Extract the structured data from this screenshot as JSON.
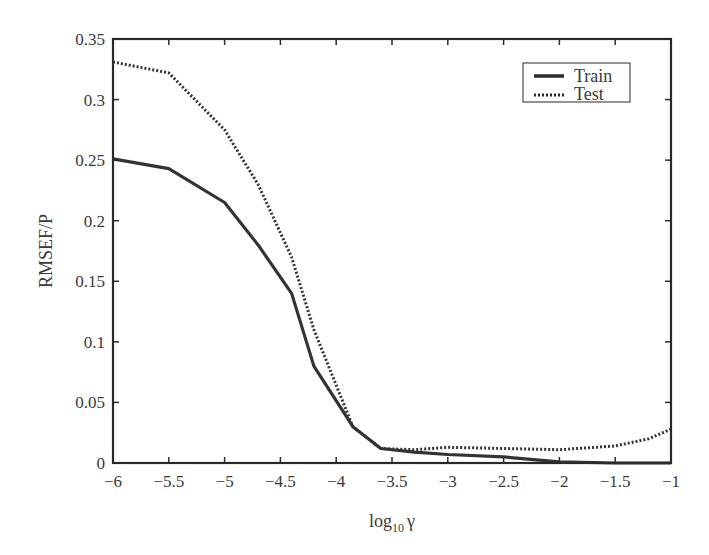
{
  "chart_data": {
    "type": "line",
    "title": "",
    "xlabel": "log10 γ",
    "xlabel_base": "log",
    "xlabel_sub": "10",
    "xlabel_var": "γ",
    "ylabel": "RMSEF/P",
    "xlim": [
      -6,
      -1
    ],
    "ylim": [
      0,
      0.35
    ],
    "xticks": [
      -6,
      -5.5,
      -5,
      -4.5,
      -4,
      -3.5,
      -3,
      -2.5,
      -2,
      -1.5,
      -1
    ],
    "xtick_labels": [
      "−6",
      "−5.5",
      "−5",
      "−4.5",
      "−4",
      "−3.5",
      "−3",
      "−2.5",
      "−2",
      "−1.5",
      "−1"
    ],
    "yticks": [
      0,
      0.05,
      0.1,
      0.15,
      0.2,
      0.25,
      0.3,
      0.35
    ],
    "ytick_labels": [
      "0",
      "0.05",
      "0.1",
      "0.15",
      "0.2",
      "0.25",
      "0.3",
      "0.35"
    ],
    "grid": false,
    "legend_position": "upper right",
    "series": [
      {
        "name": "Train",
        "style": "solid",
        "color": "#333333",
        "x": [
          -6,
          -5.5,
          -5,
          -4.7,
          -4.4,
          -4.2,
          -3.85,
          -3.6,
          -3.3,
          -3,
          -2.5,
          -2,
          -1.5,
          -1
        ],
        "values": [
          0.251,
          0.243,
          0.215,
          0.18,
          0.14,
          0.08,
          0.03,
          0.012,
          0.009,
          0.007,
          0.005,
          0.001,
          0.0,
          0.0
        ]
      },
      {
        "name": "Test",
        "style": "dotted",
        "color": "#333333",
        "x": [
          -6,
          -5.5,
          -5,
          -4.7,
          -4.4,
          -4.2,
          -3.85,
          -3.6,
          -3.3,
          -3,
          -2.5,
          -2,
          -1.5,
          -1.2,
          -1
        ],
        "values": [
          0.331,
          0.322,
          0.275,
          0.23,
          0.17,
          0.11,
          0.03,
          0.012,
          0.011,
          0.013,
          0.012,
          0.011,
          0.014,
          0.02,
          0.028
        ]
      }
    ]
  }
}
